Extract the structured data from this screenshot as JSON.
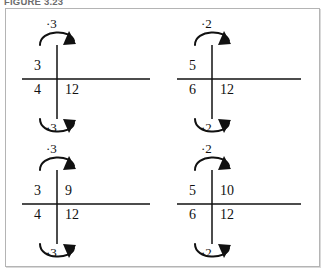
{
  "caption": "FIGURE 3.23",
  "figure": {
    "border_color": "#b4b4b4",
    "background": "#ffffff",
    "ink_color": "#111111"
  },
  "diagrams": [
    {
      "id": "top-left",
      "name": "ratio-cross-top-left",
      "top_multiplier": "·3",
      "bottom_multiplier": "·3",
      "top_left": "3",
      "top_right": "",
      "bottom_left": "4",
      "bottom_right": "12",
      "rule_length": 128
    },
    {
      "id": "top-right",
      "name": "ratio-cross-top-right",
      "top_multiplier": "·2",
      "bottom_multiplier": "·2",
      "top_left": "5",
      "top_right": "",
      "bottom_left": "6",
      "bottom_right": "12",
      "rule_length": 124
    },
    {
      "id": "bottom-left",
      "name": "ratio-cross-bottom-left",
      "top_multiplier": "·3",
      "bottom_multiplier": "·3",
      "top_left": "3",
      "top_right": "9",
      "bottom_left": "4",
      "bottom_right": "12",
      "rule_length": 128
    },
    {
      "id": "bottom-right",
      "name": "ratio-cross-bottom-right",
      "top_multiplier": "·2",
      "bottom_multiplier": "·2",
      "top_left": "5",
      "top_right": "10",
      "bottom_left": "6",
      "bottom_right": "12",
      "rule_length": 124
    }
  ]
}
